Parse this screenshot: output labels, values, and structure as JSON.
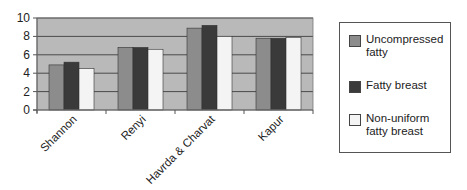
{
  "chart_data": {
    "type": "bar",
    "title": "",
    "xlabel": "",
    "ylabel": "",
    "ylim": [
      0,
      10
    ],
    "yticks": [
      0,
      2,
      4,
      6,
      8,
      10
    ],
    "grid": true,
    "legend_position": "right",
    "categories": [
      "Shannon",
      "Renyi",
      "Havrda & Charvat",
      "Kapur"
    ],
    "series": [
      {
        "name": "Uncompressed fatty",
        "color": "#8c8c8c",
        "values": [
          4.9,
          6.8,
          8.9,
          7.8
        ]
      },
      {
        "name": "Fatty breast",
        "color": "#3a3a3a",
        "values": [
          5.2,
          6.8,
          9.2,
          7.8
        ]
      },
      {
        "name": "Non-uniform fatty breast",
        "color": "#f4f4f4",
        "values": [
          4.5,
          6.6,
          8.0,
          7.9
        ]
      }
    ]
  },
  "legend": {
    "items": [
      {
        "label": "Uncompressed fatty",
        "color": "#8c8c8c"
      },
      {
        "label": "Fatty breast",
        "color": "#3a3a3a"
      },
      {
        "label": "Non-uniform fatty breast",
        "color": "#f4f4f4"
      }
    ]
  },
  "style": {
    "plot_background": "#b9b9b9",
    "gridline_color": "#4a4a4a"
  }
}
